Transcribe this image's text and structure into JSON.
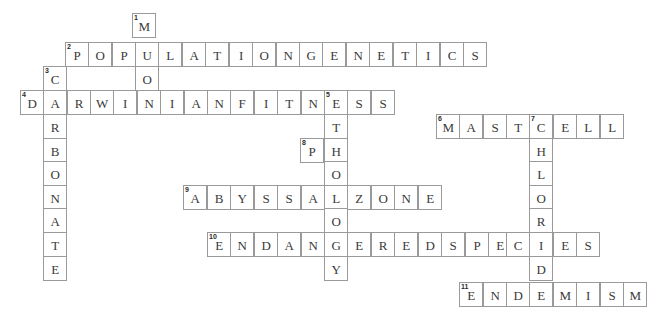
{
  "puzzle": {
    "title": "Biology Crossword Grid",
    "geometry": {
      "cell_w": 23.4,
      "cell_h": 23.5,
      "origin_x": 20,
      "origin_y": 13
    },
    "entries": [
      {
        "number": "1",
        "answer": "MOON",
        "direction": "down",
        "col": 4,
        "row": 0
      },
      {
        "number": "2",
        "answer": "POPULATIONGENETICS",
        "direction": "across",
        "col": 2,
        "row": 1
      },
      {
        "number": "3",
        "answer": "CARBONATE",
        "direction": "down",
        "col": 1,
        "row": 2
      },
      {
        "number": "4",
        "answer": "DARWINIANFITNESS",
        "direction": "across",
        "col": 0,
        "row": 3
      },
      {
        "number": "5",
        "answer": "ETHOLOGY",
        "direction": "down",
        "col": 13,
        "row": 3
      },
      {
        "number": "6",
        "answer": "MASTCELL",
        "direction": "across",
        "col": 18,
        "row": 4
      },
      {
        "number": "7",
        "answer": "CHLORIDE",
        "direction": "down",
        "col": 22,
        "row": 4
      },
      {
        "number": "8",
        "answer": "PH",
        "direction": "across",
        "col": 12,
        "row": 5
      },
      {
        "number": "9",
        "answer": "ABYSSALZONE",
        "direction": "across",
        "col": 7,
        "row": 7
      },
      {
        "number": "10",
        "answer": "ENDANGEREDSPECIES",
        "direction": "across",
        "col": 8,
        "row": 9
      },
      {
        "number": "11",
        "answer": "ENDEMISM",
        "direction": "across",
        "col": 19,
        "row": 11
      }
    ],
    "cells": [
      {
        "num": "1",
        "letter": "M",
        "x": 132,
        "y": 13
      },
      {
        "num": "2",
        "letter": "P",
        "x": 65,
        "y": 42
      },
      {
        "num": "",
        "letter": "O",
        "x": 88,
        "y": 42
      },
      {
        "num": "",
        "letter": "P",
        "x": 112,
        "y": 42
      },
      {
        "num": "",
        "letter": "U",
        "x": 135,
        "y": 42
      },
      {
        "num": "",
        "letter": "L",
        "x": 158,
        "y": 42
      },
      {
        "num": "",
        "letter": "A",
        "x": 182,
        "y": 42
      },
      {
        "num": "",
        "letter": "T",
        "x": 205,
        "y": 42
      },
      {
        "num": "",
        "letter": "I",
        "x": 229,
        "y": 42
      },
      {
        "num": "",
        "letter": "O",
        "x": 252,
        "y": 42
      },
      {
        "num": "",
        "letter": "N",
        "x": 276,
        "y": 42
      },
      {
        "num": "",
        "letter": "G",
        "x": 299,
        "y": 42
      },
      {
        "num": "",
        "letter": "E",
        "x": 322,
        "y": 42
      },
      {
        "num": "",
        "letter": "N",
        "x": 346,
        "y": 42
      },
      {
        "num": "",
        "letter": "E",
        "x": 369,
        "y": 42
      },
      {
        "num": "",
        "letter": "T",
        "x": 393,
        "y": 42
      },
      {
        "num": "",
        "letter": "I",
        "x": 416,
        "y": 42
      },
      {
        "num": "",
        "letter": "C",
        "x": 440,
        "y": 42
      },
      {
        "num": "",
        "letter": "S",
        "x": 463,
        "y": 42
      },
      {
        "num": "3",
        "letter": "C",
        "x": 43,
        "y": 66
      },
      {
        "num": "",
        "letter": "O",
        "x": 135,
        "y": 66
      },
      {
        "num": "4",
        "letter": "D",
        "x": 20,
        "y": 90
      },
      {
        "num": "",
        "letter": "A",
        "x": 43,
        "y": 90
      },
      {
        "num": "",
        "letter": "R",
        "x": 67,
        "y": 90
      },
      {
        "num": "",
        "letter": "W",
        "x": 90,
        "y": 90
      },
      {
        "num": "",
        "letter": "I",
        "x": 113,
        "y": 90
      },
      {
        "num": "",
        "letter": "N",
        "x": 137,
        "y": 90
      },
      {
        "num": "",
        "letter": "I",
        "x": 160,
        "y": 90
      },
      {
        "num": "",
        "letter": "A",
        "x": 184,
        "y": 90
      },
      {
        "num": "",
        "letter": "N",
        "x": 207,
        "y": 90
      },
      {
        "num": "",
        "letter": "F",
        "x": 230,
        "y": 90
      },
      {
        "num": "",
        "letter": "I",
        "x": 254,
        "y": 90
      },
      {
        "num": "",
        "letter": "T",
        "x": 277,
        "y": 90
      },
      {
        "num": "",
        "letter": "N",
        "x": 301,
        "y": 90
      },
      {
        "num": "5",
        "letter": "E",
        "x": 324,
        "y": 90
      },
      {
        "num": "",
        "letter": "S",
        "x": 347,
        "y": 90
      },
      {
        "num": "",
        "letter": "S",
        "x": 371,
        "y": 90
      },
      {
        "num": "",
        "letter": "R",
        "x": 43,
        "y": 114
      },
      {
        "num": "",
        "letter": "T",
        "x": 324,
        "y": 114
      },
      {
        "num": "6",
        "letter": "M",
        "x": 436,
        "y": 114
      },
      {
        "num": "",
        "letter": "A",
        "x": 459,
        "y": 114
      },
      {
        "num": "",
        "letter": "S",
        "x": 483,
        "y": 114
      },
      {
        "num": "",
        "letter": "T",
        "x": 506,
        "y": 114
      },
      {
        "num": "7",
        "letter": "C",
        "x": 529,
        "y": 114
      },
      {
        "num": "",
        "letter": "E",
        "x": 553,
        "y": 114
      },
      {
        "num": "",
        "letter": "L",
        "x": 576,
        "y": 114
      },
      {
        "num": "",
        "letter": "L",
        "x": 600,
        "y": 114
      },
      {
        "num": "",
        "letter": "B",
        "x": 43,
        "y": 138
      },
      {
        "num": "8",
        "letter": "P",
        "x": 300,
        "y": 138
      },
      {
        "num": "",
        "letter": "H",
        "x": 324,
        "y": 138
      },
      {
        "num": "",
        "letter": "H",
        "x": 529,
        "y": 138
      },
      {
        "num": "",
        "letter": "O",
        "x": 43,
        "y": 161
      },
      {
        "num": "",
        "letter": "O",
        "x": 324,
        "y": 161
      },
      {
        "num": "",
        "letter": "L",
        "x": 529,
        "y": 161
      },
      {
        "num": "",
        "letter": "N",
        "x": 43,
        "y": 185
      },
      {
        "num": "9",
        "letter": "A",
        "x": 183,
        "y": 185
      },
      {
        "num": "",
        "letter": "B",
        "x": 207,
        "y": 185
      },
      {
        "num": "",
        "letter": "Y",
        "x": 230,
        "y": 185
      },
      {
        "num": "",
        "letter": "S",
        "x": 254,
        "y": 185
      },
      {
        "num": "",
        "letter": "S",
        "x": 277,
        "y": 185
      },
      {
        "num": "",
        "letter": "A",
        "x": 301,
        "y": 185
      },
      {
        "num": "",
        "letter": "L",
        "x": 324,
        "y": 185
      },
      {
        "num": "",
        "letter": "Z",
        "x": 347,
        "y": 185
      },
      {
        "num": "",
        "letter": "O",
        "x": 371,
        "y": 185
      },
      {
        "num": "",
        "letter": "N",
        "x": 394,
        "y": 185
      },
      {
        "num": "",
        "letter": "E",
        "x": 418,
        "y": 185
      },
      {
        "num": "",
        "letter": "O",
        "x": 529,
        "y": 185
      },
      {
        "num": "",
        "letter": "A",
        "x": 43,
        "y": 208
      },
      {
        "num": "",
        "letter": "O",
        "x": 324,
        "y": 208
      },
      {
        "num": "",
        "letter": "R",
        "x": 529,
        "y": 208
      },
      {
        "num": "",
        "letter": "T",
        "x": 43,
        "y": 232
      },
      {
        "num": "10",
        "letter": "E",
        "x": 207,
        "y": 232
      },
      {
        "num": "",
        "letter": "N",
        "x": 230,
        "y": 232
      },
      {
        "num": "",
        "letter": "D",
        "x": 254,
        "y": 232
      },
      {
        "num": "",
        "letter": "A",
        "x": 277,
        "y": 232
      },
      {
        "num": "",
        "letter": "N",
        "x": 301,
        "y": 232
      },
      {
        "num": "",
        "letter": "G",
        "x": 324,
        "y": 232
      },
      {
        "num": "",
        "letter": "E",
        "x": 347,
        "y": 232
      },
      {
        "num": "",
        "letter": "R",
        "x": 371,
        "y": 232
      },
      {
        "num": "",
        "letter": "E",
        "x": 394,
        "y": 232
      },
      {
        "num": "",
        "letter": "D",
        "x": 418,
        "y": 232
      },
      {
        "num": "",
        "letter": "S",
        "x": 441,
        "y": 232
      },
      {
        "num": "",
        "letter": "P",
        "x": 465,
        "y": 232
      },
      {
        "num": "",
        "letter": "E",
        "x": 488,
        "y": 232
      },
      {
        "num": "",
        "letter": "C",
        "x": 506,
        "y": 232
      },
      {
        "num": "",
        "letter": "I",
        "x": 529,
        "y": 232
      },
      {
        "num": "",
        "letter": "E",
        "x": 553,
        "y": 232
      },
      {
        "num": "",
        "letter": "S",
        "x": 576,
        "y": 232
      },
      {
        "num": "",
        "letter": "E",
        "x": 43,
        "y": 256
      },
      {
        "num": "",
        "letter": "Y",
        "x": 324,
        "y": 256
      },
      {
        "num": "",
        "letter": "D",
        "x": 529,
        "y": 256
      },
      {
        "num": "11",
        "letter": "E",
        "x": 459,
        "y": 282
      },
      {
        "num": "",
        "letter": "N",
        "x": 483,
        "y": 282
      },
      {
        "num": "",
        "letter": "D",
        "x": 506,
        "y": 282
      },
      {
        "num": "",
        "letter": "E",
        "x": 529,
        "y": 282
      },
      {
        "num": "",
        "letter": "M",
        "x": 553,
        "y": 282
      },
      {
        "num": "",
        "letter": "I",
        "x": 576,
        "y": 282
      },
      {
        "num": "",
        "letter": "S",
        "x": 600,
        "y": 282
      },
      {
        "num": "",
        "letter": "M",
        "x": 623,
        "y": 282
      }
    ]
  }
}
